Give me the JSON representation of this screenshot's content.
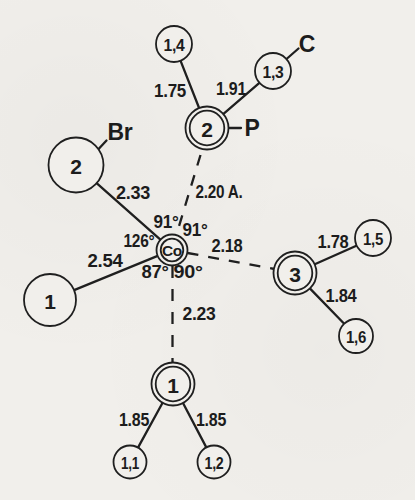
{
  "figure": {
    "central_atom": {
      "symbol": "Co"
    },
    "element_labels": {
      "br": "Br",
      "p": "P",
      "c": "C"
    },
    "atom_circles": {
      "p": "2",
      "br": "2",
      "n3": "3",
      "left1": "1",
      "bottom1": "1",
      "a14": "1,4",
      "a13": "1,3",
      "a15": "1,5",
      "a16": "1,6",
      "a11": "1,1",
      "a12": "1,2"
    },
    "bond_lengths": {
      "co_br": "2.33",
      "co_p": "2.20 A.",
      "co_n3": "2.18",
      "co_left1": "2.54",
      "co_bottom1": "2.23",
      "p_a14": "1.75",
      "p_a13": "1.91",
      "n3_a15": "1.78",
      "n3_a16": "1.84",
      "bottom1_a11": "1.85",
      "bottom1_a12": "1.85"
    },
    "angles": {
      "br_co_p": "91°",
      "p_co_n3": "91°",
      "left1_co_br": "126°",
      "left1_co_bottom1": "87°",
      "bottom1_co_n3": "90°"
    },
    "colors": {
      "ink": "#1f1f1f",
      "paper": "#f1efeb"
    }
  }
}
